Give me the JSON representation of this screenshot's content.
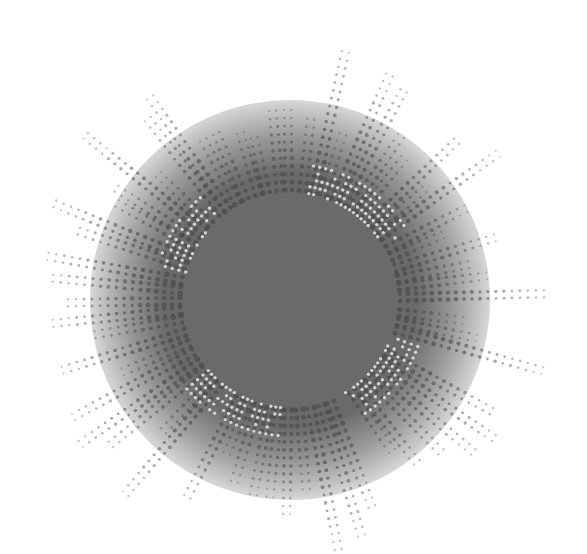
{
  "artwork": {
    "description": "Abstract grayscale halftone burst",
    "background": "#ffffff",
    "center": [
      290,
      300
    ],
    "core_radius": 120,
    "core_color": "#6a6a6a",
    "glow_radius": 200,
    "rays": {
      "count": 64,
      "inner_radius": 110,
      "outer_radius_min": 170,
      "outer_radius_max": 265,
      "dot_spacing": 8,
      "rows_per_ray": 2,
      "dot_radius_max": 2.6,
      "dot_color": "#505050"
    },
    "light_ring": {
      "radius_min": 108,
      "radius_max": 140,
      "dot_color": "#e4e4e4",
      "arcs_deg": [
        [
          -80,
          -30
        ],
        [
          195,
          230
        ],
        [
          20,
          60
        ],
        [
          95,
          140
        ]
      ]
    }
  }
}
